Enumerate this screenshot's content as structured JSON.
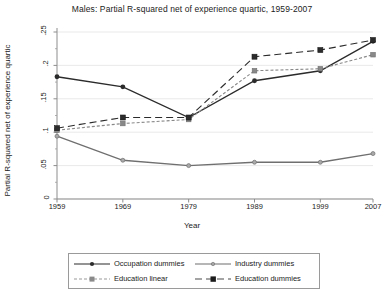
{
  "chart_data": {
    "type": "line",
    "title": "Males: Partial R-squared net of experience quartic, 1959-2007",
    "xlabel": "Year",
    "ylabel": "Partial R-squared net of experience quartic",
    "categories": [
      "1959",
      "1969",
      "1979",
      "1989",
      "1999",
      "2007"
    ],
    "x": [
      1959,
      1969,
      1979,
      1989,
      1999,
      2007
    ],
    "xlim": [
      1959,
      2007
    ],
    "ylim": [
      0,
      0.25
    ],
    "yticks": [
      "0",
      ".05",
      ".1",
      ".15",
      ".2",
      ".25"
    ],
    "ytick_values": [
      0,
      0.05,
      0.1,
      0.15,
      0.2,
      0.25
    ],
    "xticks": [
      "1959",
      "1969",
      "1979",
      "1989",
      "1999",
      "2007"
    ],
    "grid": true,
    "legend_position": "bottom",
    "series": [
      {
        "name": "Occupation dummies",
        "style": "solid",
        "marker": "circle",
        "color": "#2b2b2b",
        "values": [
          0.183,
          0.168,
          0.122,
          0.177,
          0.192,
          0.236
        ]
      },
      {
        "name": "Industry dummies",
        "style": "solid",
        "marker": "circle-small",
        "color": "#6f6f6f",
        "values": [
          0.094,
          0.058,
          0.05,
          0.055,
          0.055,
          0.068
        ]
      },
      {
        "name": "Education linear",
        "style": "dashed",
        "marker": "square",
        "color": "#888888",
        "values": [
          0.103,
          0.113,
          0.119,
          0.192,
          0.195,
          0.216
        ]
      },
      {
        "name": "Education dummies",
        "style": "dashed",
        "marker": "square",
        "color": "#2b2b2b",
        "values": [
          0.106,
          0.122,
          0.122,
          0.213,
          0.223,
          0.238
        ]
      }
    ]
  },
  "legend": {
    "items": [
      "Occupation dummies",
      "Industry dummies",
      "Education linear",
      "Education dummies"
    ]
  }
}
